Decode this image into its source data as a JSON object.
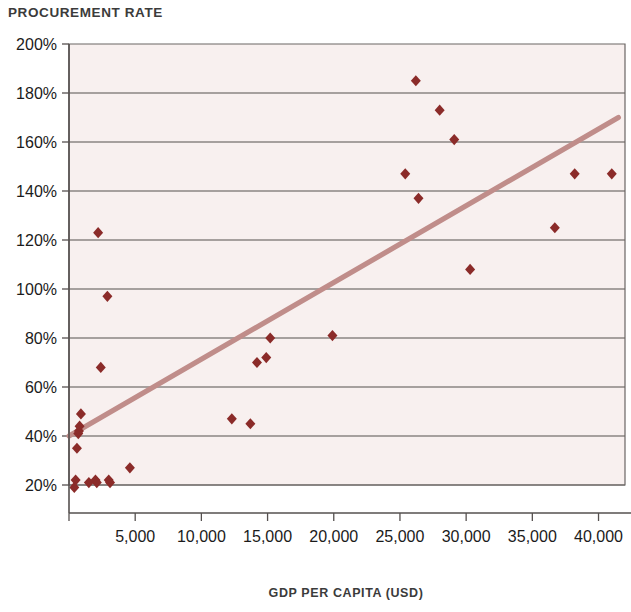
{
  "chart_data": {
    "type": "scatter",
    "title": "PROCUREMENT RATE",
    "xlabel": "GDP PER CAPITA (USD)",
    "ylabel": "",
    "xlim": [
      0,
      42000
    ],
    "ylim": [
      0,
      200
    ],
    "grid": "horizontal",
    "legend": "none",
    "y_tick_labels": [
      "200%",
      "180%",
      "160%",
      "140%",
      "120%",
      "100%",
      "80%",
      "60%",
      "40%",
      "20%"
    ],
    "y_ticks": [
      200,
      180,
      160,
      140,
      120,
      100,
      80,
      60,
      40,
      20
    ],
    "x_tick_labels": [
      "5,000",
      "10,000",
      "15,000",
      "20,000",
      "25,000",
      "30,000",
      "35,000",
      "40,000"
    ],
    "x_ticks": [
      5000,
      10000,
      15000,
      20000,
      25000,
      30000,
      35000,
      40000
    ],
    "series": [
      {
        "name": "Countries",
        "marker": "diamond",
        "color": "#8b2b29",
        "points": [
          {
            "x": 400,
            "y": 19
          },
          {
            "x": 500,
            "y": 22
          },
          {
            "x": 600,
            "y": 35
          },
          {
            "x": 700,
            "y": 41
          },
          {
            "x": 750,
            "y": 42
          },
          {
            "x": 800,
            "y": 44
          },
          {
            "x": 900,
            "y": 49
          },
          {
            "x": 1500,
            "y": 21
          },
          {
            "x": 2000,
            "y": 22
          },
          {
            "x": 2100,
            "y": 21
          },
          {
            "x": 2200,
            "y": 123
          },
          {
            "x": 2400,
            "y": 68
          },
          {
            "x": 2900,
            "y": 97
          },
          {
            "x": 3000,
            "y": 22
          },
          {
            "x": 3100,
            "y": 21
          },
          {
            "x": 4600,
            "y": 27
          },
          {
            "x": 12300,
            "y": 47
          },
          {
            "x": 13700,
            "y": 45
          },
          {
            "x": 14200,
            "y": 70
          },
          {
            "x": 14900,
            "y": 72
          },
          {
            "x": 15200,
            "y": 80
          },
          {
            "x": 19900,
            "y": 81
          },
          {
            "x": 25400,
            "y": 147
          },
          {
            "x": 26200,
            "y": 185
          },
          {
            "x": 26400,
            "y": 137
          },
          {
            "x": 28000,
            "y": 173
          },
          {
            "x": 29100,
            "y": 161
          },
          {
            "x": 30300,
            "y": 108
          },
          {
            "x": 36700,
            "y": 125
          },
          {
            "x": 38200,
            "y": 147
          },
          {
            "x": 41000,
            "y": 147
          }
        ]
      }
    ],
    "trendline": {
      "name": "Linear trend",
      "color": "#c08d8a",
      "width": 5.2,
      "x_start": 0,
      "y_start": 40,
      "x_end": 41500,
      "y_end": 170
    }
  }
}
